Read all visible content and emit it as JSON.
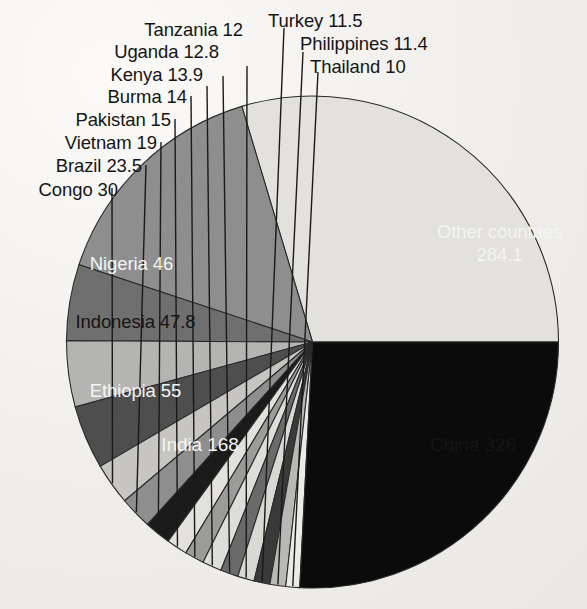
{
  "chart_data": {
    "type": "pie",
    "title": "",
    "subtitle": "",
    "unit": "millions",
    "total": 1100,
    "legend_position": "none",
    "grid": false,
    "start_angle_deg": 0,
    "direction": "counterclockwise",
    "categories": [
      "China",
      "India",
      "Ethiopia",
      "Indonesia",
      "Nigeria",
      "Congo",
      "Brazil",
      "Vietnam",
      "Pakistan",
      "Burma",
      "Kenya",
      "Uganda",
      "Tanzania",
      "Turkey",
      "Philippines",
      "Thailand",
      "Other countries"
    ],
    "values": [
      326,
      168,
      55,
      47.8,
      46,
      30,
      23.5,
      19,
      15,
      14,
      13.9,
      12.8,
      12,
      11.5,
      11.4,
      10,
      284.1
    ],
    "slices": [
      {
        "name": "China",
        "label": "China 326",
        "value": 326,
        "color": "#e2e1dd",
        "label_mode": "inside",
        "label_color": "dark"
      },
      {
        "name": "India",
        "label": "India 168",
        "value": 168,
        "color": "#8e8e8e",
        "label_mode": "inside",
        "label_color": "light"
      },
      {
        "name": "Ethiopia",
        "label": "Ethiopia 55",
        "value": 55,
        "color": "#6f6f6f",
        "label_mode": "inside",
        "label_color": "light"
      },
      {
        "name": "Indonesia",
        "label": "Indonesia 47.8",
        "value": 47.8,
        "color": "#b4b4b2",
        "label_mode": "inside",
        "label_color": "dark"
      },
      {
        "name": "Nigeria",
        "label": "Nigeria 46",
        "value": 46,
        "color": "#4e4e4e",
        "label_mode": "inside",
        "label_color": "light"
      },
      {
        "name": "Congo",
        "label": "Congo 30",
        "value": 30,
        "color": "#c6c5c2",
        "label_mode": "leader",
        "label_color": "dark"
      },
      {
        "name": "Brazil",
        "label": "Brazil 23.5",
        "value": 23.5,
        "color": "#8e8e8e",
        "label_mode": "leader",
        "label_color": "dark"
      },
      {
        "name": "Vietnam",
        "label": "Vietnam 19",
        "value": 19,
        "color": "#1b1b1b",
        "label_mode": "leader",
        "label_color": "dark"
      },
      {
        "name": "Pakistan",
        "label": "Pakistan 15",
        "value": 15,
        "color": "#e2e1dd",
        "label_mode": "leader",
        "label_color": "dark"
      },
      {
        "name": "Burma",
        "label": "Burma 14",
        "value": 14,
        "color": "#9b9b99",
        "label_mode": "leader",
        "label_color": "dark"
      },
      {
        "name": "Kenya",
        "label": "Kenya 13.9",
        "value": 13.9,
        "color": "#dedddA",
        "label_mode": "leader",
        "label_color": "dark"
      },
      {
        "name": "Uganda",
        "label": "Uganda 12.8",
        "value": 12.8,
        "color": "#6a6a6a",
        "label_mode": "leader",
        "label_color": "dark"
      },
      {
        "name": "Tanzania",
        "label": "Tanzania 12",
        "value": 12,
        "color": "#d9d8d4",
        "label_mode": "leader",
        "label_color": "dark"
      },
      {
        "name": "Turkey",
        "label": "Turkey 11.5",
        "value": 11.5,
        "color": "#3a3a3a",
        "label_mode": "leader",
        "label_color": "dark"
      },
      {
        "name": "Philippines",
        "label": "Philippines 11.4",
        "value": 11.4,
        "color": "#b9b8b5",
        "label_mode": "leader",
        "label_color": "dark"
      },
      {
        "name": "Thailand",
        "label": "Thailand 10",
        "value": 10,
        "color": "#ebeae7",
        "label_mode": "leader",
        "label_color": "dark"
      },
      {
        "name": "Other countries",
        "label": "Other countries",
        "value": 284.1,
        "color": "#0b0b0b",
        "label_mode": "inside",
        "label_color": "light"
      }
    ]
  },
  "labels": {
    "china": "China 326",
    "india": "India 168",
    "ethiopia": "Ethiopia 55",
    "indonesia": "Indonesia 47.8",
    "nigeria": "Nigeria 46",
    "congo": "Congo 30",
    "brazil": "Brazil 23.5",
    "vietnam": "Vietnam 19",
    "pakistan": "Pakistan 15",
    "burma": "Burma 14",
    "kenya": "Kenya 13.9",
    "uganda": "Uganda 12.8",
    "tanzania": "Tanzania 12",
    "turkey": "Turkey 11.5",
    "philippines": "Philippines 11.4",
    "thailand": "Thailand 10",
    "other_line1": "Other countries",
    "other_line2": "284.1"
  }
}
